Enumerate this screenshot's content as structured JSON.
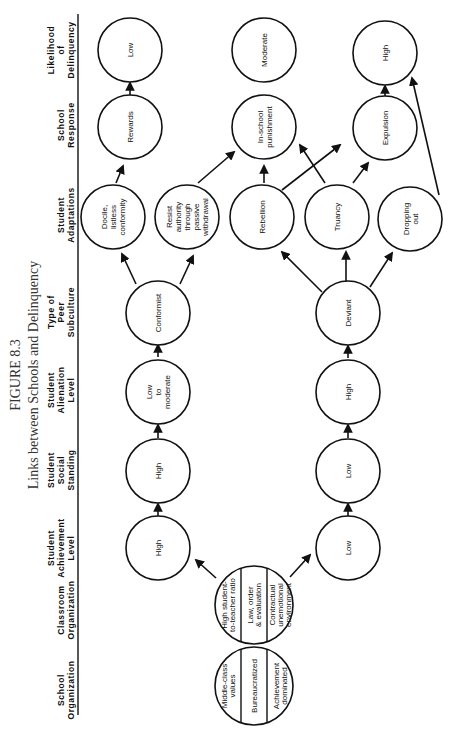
{
  "figure": {
    "number": "FIGURE 8.3",
    "title": "Links between Schools and Delinquency"
  },
  "columns": [
    {
      "id": "school_org",
      "lines": [
        "School",
        "Organization"
      ],
      "pos": 690
    },
    {
      "id": "classroom_org",
      "lines": [
        "Classroom",
        "Organization"
      ],
      "pos": 610
    },
    {
      "id": "achievement",
      "lines": [
        "Student",
        "Achievement",
        "Level"
      ],
      "pos": 548
    },
    {
      "id": "social",
      "lines": [
        "Student",
        "Social",
        "Standing"
      ],
      "pos": 470
    },
    {
      "id": "alienation",
      "lines": [
        "Student",
        "Alienation",
        "Level"
      ],
      "pos": 390
    },
    {
      "id": "peer",
      "lines": [
        "Type of",
        "Peer",
        "Subculture"
      ],
      "pos": 312
    },
    {
      "id": "adaptations",
      "lines": [
        "Student",
        "Adaptations"
      ],
      "pos": 215
    },
    {
      "id": "response",
      "lines": [
        "School",
        "Response"
      ],
      "pos": 125
    },
    {
      "id": "likelihood",
      "lines": [
        "Likelihood",
        "of",
        "Delinquency"
      ],
      "pos": 50
    }
  ],
  "nodes": {
    "school_org": {
      "segments": [
        "Middle-class values",
        "Bureaucratized",
        "Achievement dominated"
      ]
    },
    "classroom_org": {
      "segments": [
        "High student-to-teacher ratio",
        "Law, order & evaluation",
        "Contractual unemotional environment"
      ]
    },
    "ach_high": "High",
    "ach_low": "Low",
    "soc_high": "High",
    "soc_low": "Low",
    "alien_lowmod": "Low to moderate",
    "alien_high": "High",
    "peer_conf": "Conformist",
    "peer_dev": "Deviant",
    "adapt_docile": "Docile, listless conformity",
    "adapt_resist": "Resist authority through passive withdrawal",
    "adapt_rebel": "Rebellion",
    "adapt_truancy": "Truancy",
    "adapt_drop": "Dropping out",
    "resp_rewards": "Rewards",
    "resp_punish": "In-school punishment",
    "resp_expel": "Expulsion",
    "like_low": "Low",
    "like_mod": "Moderate",
    "like_high": "High"
  }
}
